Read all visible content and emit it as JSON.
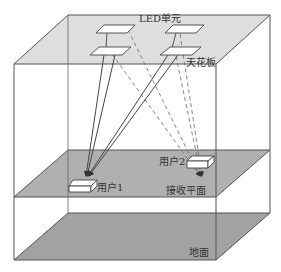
{
  "diagram": {
    "labels": {
      "led_unit": "LED单元",
      "ceiling": "天花板",
      "user1": "用户1",
      "user2": "用户2",
      "receiving_plane": "接收平面",
      "floor": "地面"
    },
    "colors": {
      "ceiling_fill": "#dcdcdc",
      "plane_fill": "#a8a8a8",
      "floor_fill": "#a0a0a0",
      "edge": "#555555",
      "panel_fill": "#ffffff",
      "ray_solid": "#444444",
      "ray_dashed": "#777777"
    },
    "nodes": [
      {
        "id": "led-back-left",
        "type": "led-panel"
      },
      {
        "id": "led-back-right",
        "type": "led-panel"
      },
      {
        "id": "led-front-left",
        "type": "led-panel"
      },
      {
        "id": "led-front-right",
        "type": "led-panel"
      },
      {
        "id": "user1",
        "type": "receiver"
      },
      {
        "id": "user2",
        "type": "receiver"
      }
    ],
    "edges": [
      {
        "from": "led-back-left",
        "to": "user1",
        "style": "solid-arrow"
      },
      {
        "from": "led-front-left",
        "to": "user1",
        "style": "solid-arrow"
      },
      {
        "from": "led-back-right",
        "to": "user1",
        "style": "solid-arrow"
      },
      {
        "from": "led-front-right",
        "to": "user1",
        "style": "solid-arrow"
      },
      {
        "from": "led-back-left",
        "to": "user2",
        "style": "dashed-arrow"
      },
      {
        "from": "led-front-left",
        "to": "user2",
        "style": "dashed-arrow"
      },
      {
        "from": "led-back-right",
        "to": "user2",
        "style": "dashed-arrow"
      },
      {
        "from": "led-front-right",
        "to": "user2",
        "style": "dashed-arrow"
      }
    ]
  }
}
